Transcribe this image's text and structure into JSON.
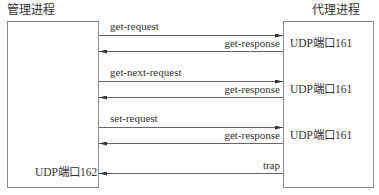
{
  "diagram": {
    "type": "sequence",
    "left_process": {
      "title": "管理进程",
      "port_label": "UDP端口162"
    },
    "right_process": {
      "title": "代理进程",
      "port_labels": [
        "UDP端口161",
        "UDP端口161",
        "UDP端口161"
      ]
    },
    "messages": [
      {
        "label": "get-request",
        "direction": "left-to-right"
      },
      {
        "label": "get-response",
        "direction": "right-to-left"
      },
      {
        "label": "get-next-request",
        "direction": "left-to-right"
      },
      {
        "label": "get-response",
        "direction": "right-to-left"
      },
      {
        "label": "set-request",
        "direction": "left-to-right"
      },
      {
        "label": "get-response",
        "direction": "right-to-left"
      },
      {
        "label": "trap",
        "direction": "right-to-left"
      }
    ],
    "colors": {
      "line": "#555555",
      "box_border": "#8a8a8a",
      "text": "#333333"
    }
  }
}
